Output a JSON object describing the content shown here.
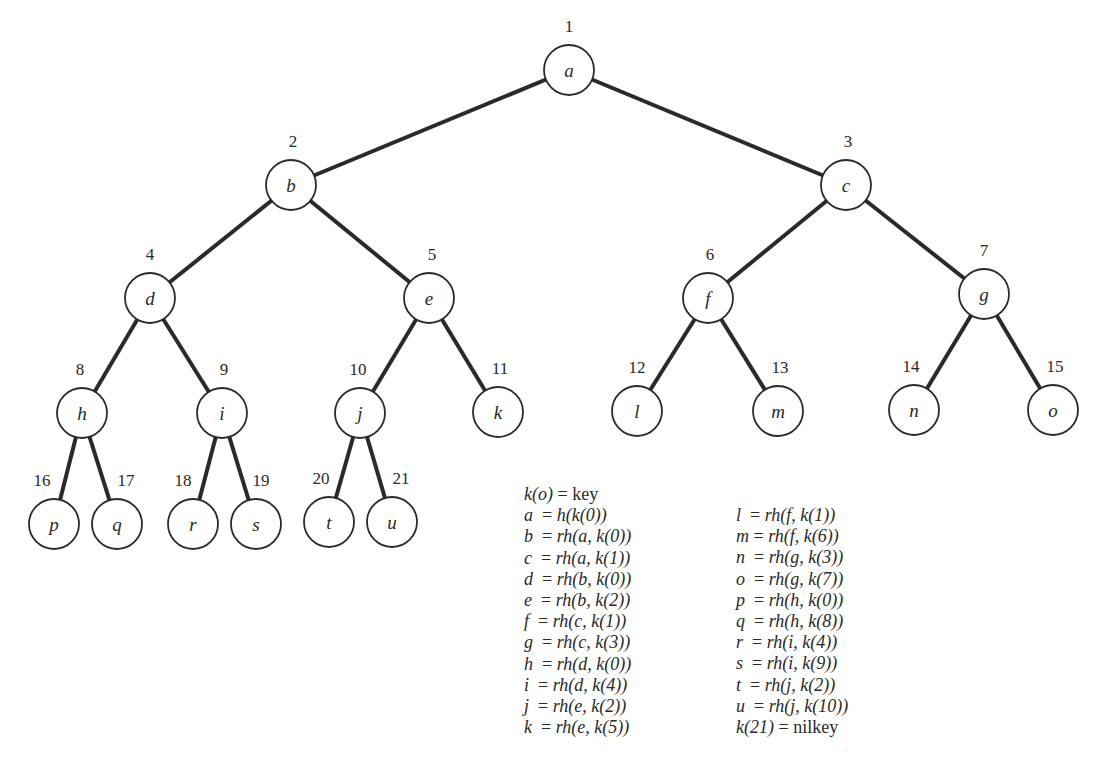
{
  "nodes": [
    {
      "id": 1,
      "label": "a",
      "x": 569,
      "y": 70,
      "num_dx": 0,
      "num_dy": -38
    },
    {
      "id": 2,
      "label": "b",
      "x": 291,
      "y": 185,
      "num_dx": 2,
      "num_dy": -38
    },
    {
      "id": 3,
      "label": "c",
      "x": 846,
      "y": 185,
      "num_dx": 2,
      "num_dy": -38
    },
    {
      "id": 4,
      "label": "d",
      "x": 150,
      "y": 298,
      "num_dx": 0,
      "num_dy": -38
    },
    {
      "id": 5,
      "label": "e",
      "x": 429,
      "y": 298,
      "num_dx": 3,
      "num_dy": -38
    },
    {
      "id": 6,
      "label": "f",
      "x": 708,
      "y": 298,
      "num_dx": 2,
      "num_dy": -38
    },
    {
      "id": 7,
      "label": "g",
      "x": 984,
      "y": 294,
      "num_dx": 0,
      "num_dy": -38
    },
    {
      "id": 8,
      "label": "h",
      "x": 82,
      "y": 413,
      "num_dx": -2,
      "num_dy": -38
    },
    {
      "id": 9,
      "label": "i",
      "x": 222,
      "y": 413,
      "num_dx": 2,
      "num_dy": -38
    },
    {
      "id": 10,
      "label": "j",
      "x": 360,
      "y": 413,
      "num_dx": -2,
      "num_dy": -38
    },
    {
      "id": 11,
      "label": "k",
      "x": 498,
      "y": 412,
      "num_dx": 2,
      "num_dy": -38
    },
    {
      "id": 12,
      "label": "l",
      "x": 637,
      "y": 411,
      "num_dx": 0,
      "num_dy": -38
    },
    {
      "id": 13,
      "label": "m",
      "x": 778,
      "y": 411,
      "num_dx": 2,
      "num_dy": -38
    },
    {
      "id": 14,
      "label": "n",
      "x": 914,
      "y": 410,
      "num_dx": -3,
      "num_dy": -38
    },
    {
      "id": 15,
      "label": "o",
      "x": 1053,
      "y": 410,
      "num_dx": 2,
      "num_dy": -38
    },
    {
      "id": 16,
      "label": "p",
      "x": 54,
      "y": 524,
      "num_dx": -12,
      "num_dy": -38
    },
    {
      "id": 17,
      "label": "q",
      "x": 117,
      "y": 524,
      "num_dx": 9,
      "num_dy": -38
    },
    {
      "id": 18,
      "label": "r",
      "x": 193,
      "y": 524,
      "num_dx": -10,
      "num_dy": -38
    },
    {
      "id": 19,
      "label": "s",
      "x": 256,
      "y": 524,
      "num_dx": 5,
      "num_dy": -38
    },
    {
      "id": 20,
      "label": "t",
      "x": 329,
      "y": 522,
      "num_dx": -8,
      "num_dy": -38
    },
    {
      "id": 21,
      "label": "u",
      "x": 392,
      "y": 522,
      "num_dx": 9,
      "num_dy": -38
    }
  ],
  "edges": [
    [
      1,
      2
    ],
    [
      1,
      3
    ],
    [
      2,
      4
    ],
    [
      2,
      5
    ],
    [
      3,
      6
    ],
    [
      3,
      7
    ],
    [
      4,
      8
    ],
    [
      4,
      9
    ],
    [
      5,
      10
    ],
    [
      5,
      11
    ],
    [
      6,
      12
    ],
    [
      6,
      13
    ],
    [
      7,
      14
    ],
    [
      7,
      15
    ],
    [
      8,
      16
    ],
    [
      8,
      17
    ],
    [
      9,
      18
    ],
    [
      9,
      19
    ],
    [
      10,
      20
    ],
    [
      10,
      21
    ]
  ],
  "node_radius": 25,
  "legend": {
    "left": [
      {
        "lhs": "k(o)",
        "eq": " = ",
        "rhs": "key",
        "plain_rhs": true
      },
      {
        "lhs": "a ",
        "eq": " = ",
        "rhs": "h(k(0))"
      },
      {
        "lhs": "b ",
        "eq": " = ",
        "rhs": "rh(a, k(0))"
      },
      {
        "lhs": "c ",
        "eq": " = ",
        "rhs": "rh(a, k(1))"
      },
      {
        "lhs": "d ",
        "eq": " = ",
        "rhs": "rh(b, k(0))"
      },
      {
        "lhs": "e ",
        "eq": " = ",
        "rhs": "rh(b, k(2))"
      },
      {
        "lhs": "f ",
        "eq": " = ",
        "rhs": "rh(c, k(1))"
      },
      {
        "lhs": "g ",
        "eq": " = ",
        "rhs": "rh(c, k(3))"
      },
      {
        "lhs": "h ",
        "eq": " = ",
        "rhs": "rh(d, k(0))"
      },
      {
        "lhs": "i ",
        "eq": " = ",
        "rhs": "rh(d, k(4))"
      },
      {
        "lhs": "j ",
        "eq": " = ",
        "rhs": "rh(e, k(2))"
      },
      {
        "lhs": "k ",
        "eq": " = ",
        "rhs": "rh(e, k(5))"
      }
    ],
    "right": [
      {
        "lhs": "l ",
        "eq": " = ",
        "rhs": "rh(f, k(1))"
      },
      {
        "lhs": "m",
        "eq": " = ",
        "rhs": "rh(f, k(6))"
      },
      {
        "lhs": "n ",
        "eq": " = ",
        "rhs": "rh(g, k(3))"
      },
      {
        "lhs": "o ",
        "eq": " = ",
        "rhs": "rh(g, k(7))"
      },
      {
        "lhs": "p ",
        "eq": " = ",
        "rhs": "rh(h, k(0))"
      },
      {
        "lhs": "q ",
        "eq": " = ",
        "rhs": "rh(h, k(8))"
      },
      {
        "lhs": "r ",
        "eq": " = ",
        "rhs": "rh(i, k(4))"
      },
      {
        "lhs": "s ",
        "eq": " = ",
        "rhs": "rh(i, k(9))"
      },
      {
        "lhs": "t ",
        "eq": " = ",
        "rhs": "rh(j, k(2))"
      },
      {
        "lhs": "u ",
        "eq": " = ",
        "rhs": "rh(j, k(10))"
      },
      {
        "lhs": "k(21)",
        "eq": " = ",
        "rhs": "nilkey",
        "plain_rhs": true
      }
    ]
  }
}
